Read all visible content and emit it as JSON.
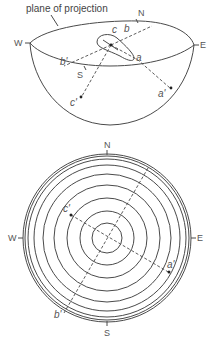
{
  "figure": {
    "top": {
      "caption": "plane of projection",
      "compass": {
        "N": "N",
        "S": "S",
        "E": "E",
        "W": "W"
      },
      "points": {
        "a": "a",
        "b": "b",
        "c": "c",
        "a_prime": "a'",
        "b_prime": "b'",
        "c_prime": "c'"
      }
    },
    "bottom": {
      "compass": {
        "N": "N",
        "S": "S",
        "E": "E",
        "W": "W"
      },
      "points": {
        "a_prime": "a'",
        "b_prime": "b'",
        "c_prime": "c'"
      },
      "circle_count": 9,
      "circle_radii_px": [
        15,
        27,
        40,
        53,
        64,
        73,
        79,
        82,
        84
      ]
    }
  },
  "colors": {
    "line": "#4a4a4a",
    "text": "#555555",
    "background": "#ffffff"
  }
}
